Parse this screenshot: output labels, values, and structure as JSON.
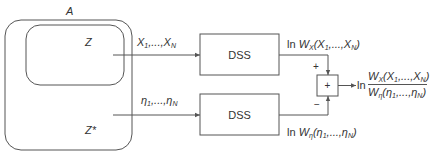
{
  "diagram": {
    "outer_set": {
      "label": "A"
    },
    "inner_set": {
      "label": "Z"
    },
    "complement_set": {
      "label": "Z*"
    },
    "input_top": {
      "label_var": "X",
      "label_sub_first": "1",
      "label_sep": ",...,",
      "label_sub_last": "N"
    },
    "input_bottom": {
      "label_var": "η",
      "label_sub_first": "1",
      "label_sep": ",...,",
      "label_sub_last": "N"
    },
    "block_top": {
      "label": "DSS"
    },
    "block_bottom": {
      "label": "DSS"
    },
    "output_top": {
      "prefix": "ln ",
      "func": "W",
      "func_sub": "X",
      "args": "(X",
      "arg_sub1": "1",
      "args_mid": ",...,X",
      "arg_subN": "N",
      "close": ")"
    },
    "output_bottom": {
      "prefix": "ln ",
      "func": "W",
      "func_sub": "η",
      "args": "(η",
      "arg_sub1": "1",
      "args_mid": ",...,η",
      "arg_subN": "N",
      "close": ")"
    },
    "summer": {
      "symbol": "+",
      "plus_sign": "+",
      "minus_sign": "−"
    },
    "result": {
      "prefix": "ln",
      "numerator": {
        "func": "W",
        "func_sub": "X",
        "args": "(X",
        "arg_sub1": "1",
        "args_mid": ",...,X",
        "arg_subN": "N",
        "close": ")"
      },
      "denominator": {
        "func": "W",
        "func_sub": "η",
        "args": "(η",
        "arg_sub1": "1",
        "args_mid": ",...,η",
        "arg_subN": "N",
        "close": ")"
      }
    }
  }
}
